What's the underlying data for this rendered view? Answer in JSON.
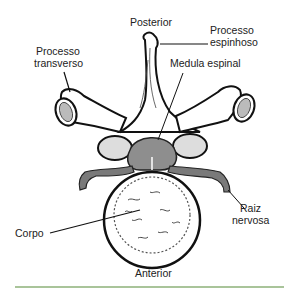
{
  "diagram": {
    "labels": {
      "posterior": "Posterior",
      "processo_espinhoso_1": "Processo",
      "processo_espinhoso_2": "espinhoso",
      "processo_transverso_1": "Processo",
      "processo_transverso_2": "transverso",
      "medula_espinal": "Medula espinal",
      "raiz_nervosa_1": "Raiz",
      "raiz_nervosa_2": "nervosa",
      "corpo": "Corpo",
      "anterior": "Anterior"
    },
    "colors": {
      "bone_fill": "#ffffff",
      "outline": "#111111",
      "nerve_fill": "#7a7a7a",
      "cord_fill": "#8e8e8e",
      "rule": "#a9c49a"
    }
  }
}
